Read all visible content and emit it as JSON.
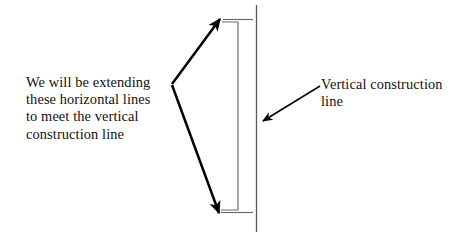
{
  "diagram": {
    "background_color": "#ffffff",
    "stroke_color": "#000000",
    "thin_stroke_color": "#555555",
    "construction_line_color": "#5a5a5a",
    "annotations": {
      "left_note": {
        "lines": [
          "We will be extending",
          "these horizontal lines",
          "to meet the vertical",
          "construction line"
        ]
      },
      "right_note": {
        "lines": [
          "Vertical construction",
          "line"
        ]
      }
    },
    "shapes": {
      "leader_vertex": {
        "x": 172,
        "y": 84
      },
      "upper_leader_tip": {
        "x": 221,
        "y": 18
      },
      "lower_leader_tip": {
        "x": 219,
        "y": 214
      },
      "bracket_right_x": 238,
      "bracket_top_y": 20,
      "bracket_bottom_y": 212,
      "extension_line_end_x": 253,
      "construction_line_x": 256,
      "construction_line_top_y": 5,
      "construction_line_bottom_y": 232,
      "callout_arrow_start": {
        "x": 320,
        "y": 87
      },
      "callout_arrow_tip": {
        "x": 262,
        "y": 122
      }
    }
  }
}
